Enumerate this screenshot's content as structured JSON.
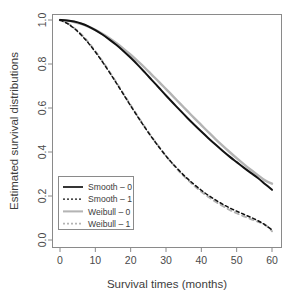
{
  "chart_data": {
    "type": "line",
    "title": "",
    "subtitle": "",
    "xlabel": "Survival times (months)",
    "ylabel": "Estimated survival distributions",
    "xlim": [
      0,
      60
    ],
    "ylim": [
      0.0,
      1.0
    ],
    "xticks": [
      0,
      10,
      20,
      30,
      40,
      50,
      60
    ],
    "xtick_labels": [
      "0",
      "10",
      "20",
      "30",
      "40",
      "50",
      "60"
    ],
    "yticks": [
      0.0,
      0.2,
      0.4,
      0.6,
      0.8,
      1.0
    ],
    "ytick_labels": [
      "0.0",
      "0.2",
      "0.4",
      "0.6",
      "0.8",
      "1.0"
    ],
    "grid": false,
    "legend_position": "bottom-left",
    "x": [
      0,
      2,
      4,
      6,
      8,
      10,
      12,
      14,
      16,
      18,
      20,
      22,
      24,
      26,
      28,
      30,
      32,
      34,
      36,
      38,
      40,
      42,
      44,
      46,
      48,
      50,
      52,
      54,
      56,
      58,
      60
    ],
    "series": [
      {
        "name": "Smooth – 0",
        "color": "#111111",
        "style": "solid",
        "width": 2.0,
        "values": [
          1.0,
          0.998,
          0.993,
          0.984,
          0.971,
          0.954,
          0.934,
          0.911,
          0.886,
          0.858,
          0.828,
          0.796,
          0.762,
          0.727,
          0.692,
          0.657,
          0.623,
          0.589,
          0.556,
          0.524,
          0.493,
          0.463,
          0.434,
          0.406,
          0.379,
          0.354,
          0.329,
          0.305,
          0.282,
          0.255,
          0.228
        ]
      },
      {
        "name": "Smooth – 1",
        "color": "#111111",
        "style": "dashed",
        "width": 1.5,
        "values": [
          1.0,
          0.985,
          0.962,
          0.932,
          0.896,
          0.855,
          0.81,
          0.762,
          0.712,
          0.661,
          0.61,
          0.56,
          0.512,
          0.466,
          0.423,
          0.382,
          0.345,
          0.311,
          0.28,
          0.252,
          0.226,
          0.203,
          0.182,
          0.163,
          0.146,
          0.131,
          0.117,
          0.103,
          0.088,
          0.069,
          0.046
        ]
      },
      {
        "name": "Weibull – 0",
        "color": "#b4b4b4",
        "style": "solid",
        "width": 2.4,
        "values": [
          1.0,
          0.997,
          0.991,
          0.982,
          0.97,
          0.955,
          0.937,
          0.917,
          0.894,
          0.869,
          0.842,
          0.813,
          0.783,
          0.751,
          0.719,
          0.686,
          0.653,
          0.62,
          0.587,
          0.554,
          0.522,
          0.49,
          0.459,
          0.429,
          0.4,
          0.372,
          0.345,
          0.319,
          0.295,
          0.271,
          0.256
        ]
      },
      {
        "name": "Weibull – 1",
        "color": "#b4b4b4",
        "style": "dashed",
        "width": 2.0,
        "values": [
          1.0,
          0.986,
          0.964,
          0.935,
          0.899,
          0.858,
          0.813,
          0.765,
          0.715,
          0.664,
          0.613,
          0.563,
          0.514,
          0.468,
          0.424,
          0.382,
          0.344,
          0.308,
          0.276,
          0.246,
          0.22,
          0.196,
          0.174,
          0.155,
          0.137,
          0.122,
          0.108,
          0.095,
          0.083,
          0.07,
          0.04
        ]
      }
    ]
  },
  "legend": {
    "entries": [
      {
        "label": "Smooth – 0"
      },
      {
        "label": "Smooth – 1"
      },
      {
        "label": "Weibull – 0"
      },
      {
        "label": "Weibull – 1"
      }
    ]
  },
  "axes": {
    "x_title": "Survival times (months)",
    "y_title": "Estimated survival distributions"
  },
  "colors": {
    "black": "#111111",
    "gray": "#b4b4b4",
    "axis": "#8a8a8a",
    "text": "#3d3d3d",
    "background": "#ffffff"
  }
}
